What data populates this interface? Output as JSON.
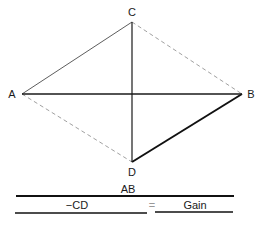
{
  "diagram": {
    "points": {
      "A": {
        "label": "A",
        "x": 22,
        "y": 94
      },
      "B": {
        "label": "B",
        "x": 242,
        "y": 94
      },
      "C": {
        "label": "C",
        "x": 132,
        "y": 22
      },
      "D": {
        "label": "D",
        "x": 132,
        "y": 162
      }
    },
    "edges": [
      {
        "from": "A",
        "to": "C",
        "style": "solid-thin"
      },
      {
        "from": "C",
        "to": "B",
        "style": "dashed"
      },
      {
        "from": "A",
        "to": "D",
        "style": "dashed"
      },
      {
        "from": "D",
        "to": "B",
        "style": "solid-thick"
      },
      {
        "from": "A",
        "to": "B",
        "style": "solid-medium"
      },
      {
        "from": "C",
        "to": "D",
        "style": "solid-medium"
      }
    ],
    "formula": {
      "numerator": "AB",
      "denominator": "−CD",
      "equals": "=",
      "result": "Gain"
    }
  }
}
